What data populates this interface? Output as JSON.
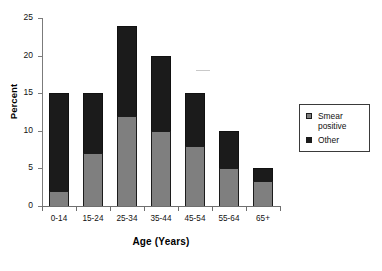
{
  "chart_data": {
    "type": "bar",
    "subtype": "stacked-vertical",
    "title": "",
    "xlabel": "Age (Years)",
    "ylabel": "Percent",
    "categories": [
      "0-14",
      "15-24",
      "25-34",
      "35-44",
      "45-54",
      "55-64",
      "65+"
    ],
    "series": [
      {
        "name": "Smear positive",
        "color": "#7f7f7f",
        "values": [
          2,
          7,
          12,
          10,
          8,
          5,
          3.3
        ]
      },
      {
        "name": "Other",
        "color": "#1b1b1b",
        "values": [
          13,
          8,
          12,
          10,
          7,
          5,
          1.7
        ]
      }
    ],
    "totals": [
      15,
      15,
      24,
      20,
      15,
      10,
      5
    ],
    "ylim": [
      0,
      25
    ],
    "yticks": [
      0,
      5,
      10,
      15,
      20,
      25
    ],
    "ytick_labels": [
      "0",
      "5",
      "10",
      "15",
      "20",
      "25"
    ],
    "grid": false,
    "legend_position": "right"
  },
  "legend": {
    "items": [
      {
        "label": "Smear positive",
        "color": "#7f7f7f"
      },
      {
        "label": "Other",
        "color": "#1b1b1b"
      }
    ]
  }
}
